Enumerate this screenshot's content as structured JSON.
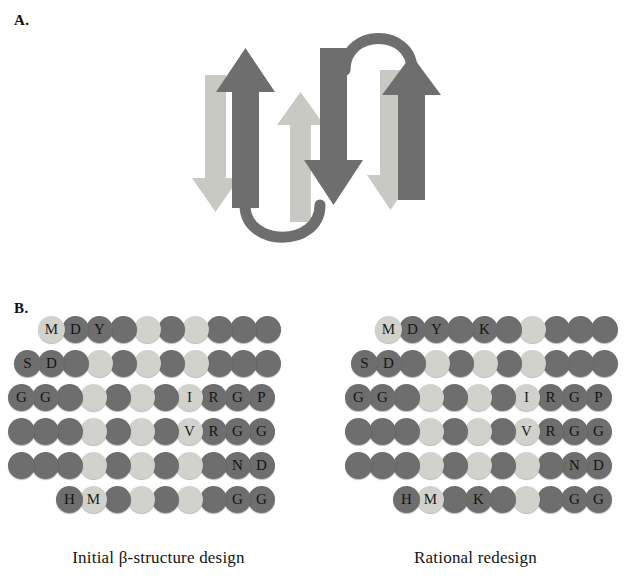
{
  "figure": {
    "panel_a_label": "A.",
    "panel_b_label": "B."
  },
  "colors": {
    "strand_dark": "#6e6e6e",
    "strand_light": "#c9c9c4",
    "residue_dark": "#6e6e6e",
    "residue_light": "#d2d2cd",
    "background": "#ffffff",
    "text": "#141414"
  },
  "panel_a": {
    "name": "beta-sheet-topology-diagram",
    "description": "Four-stranded antiparallel beta sheet topology with connecting loops",
    "strands": [
      {
        "id": "strand-1",
        "shade": "light",
        "direction": "down"
      },
      {
        "id": "strand-2",
        "shade": "dark",
        "direction": "up"
      },
      {
        "id": "strand-3",
        "shade": "light",
        "direction": "up"
      },
      {
        "id": "strand-4",
        "shade": "dark",
        "direction": "down"
      },
      {
        "id": "strand-5",
        "shade": "light",
        "direction": "down"
      },
      {
        "id": "strand-6",
        "shade": "dark",
        "direction": "up"
      }
    ],
    "loops": [
      {
        "id": "loop-top",
        "position": "top-right"
      },
      {
        "id": "loop-bottom",
        "position": "bottom-left"
      }
    ]
  },
  "panel_b": {
    "designs": [
      {
        "id": "initial-design",
        "caption": "Initial β-structure design",
        "rows": [
          {
            "indent": 38,
            "residues": [
              {
                "label": "M",
                "shade": "light"
              },
              {
                "label": "D",
                "shade": "dark"
              },
              {
                "label": "Y",
                "shade": "dark"
              },
              {
                "label": "",
                "shade": "dark"
              },
              {
                "label": "",
                "shade": "light"
              },
              {
                "label": "",
                "shade": "dark"
              },
              {
                "label": "",
                "shade": "light"
              },
              {
                "label": "",
                "shade": "dark"
              },
              {
                "label": "",
                "shade": "dark"
              },
              {
                "label": "",
                "shade": "dark"
              }
            ]
          },
          {
            "indent": 14,
            "residues": [
              {
                "label": "S",
                "shade": "dark"
              },
              {
                "label": "D",
                "shade": "dark"
              },
              {
                "label": "",
                "shade": "dark"
              },
              {
                "label": "",
                "shade": "light"
              },
              {
                "label": "",
                "shade": "dark"
              },
              {
                "label": "",
                "shade": "light"
              },
              {
                "label": "",
                "shade": "dark"
              },
              {
                "label": "",
                "shade": "light"
              },
              {
                "label": "",
                "shade": "dark"
              },
              {
                "label": "",
                "shade": "dark"
              },
              {
                "label": "",
                "shade": "dark"
              }
            ]
          },
          {
            "indent": 8,
            "residues": [
              {
                "label": "G",
                "shade": "dark"
              },
              {
                "label": "G",
                "shade": "dark"
              },
              {
                "label": "",
                "shade": "dark"
              },
              {
                "label": "",
                "shade": "light"
              },
              {
                "label": "",
                "shade": "dark"
              },
              {
                "label": "",
                "shade": "light"
              },
              {
                "label": "",
                "shade": "dark"
              },
              {
                "label": "I",
                "shade": "light"
              },
              {
                "label": "R",
                "shade": "dark"
              },
              {
                "label": "G",
                "shade": "dark"
              },
              {
                "label": "P",
                "shade": "dark"
              }
            ]
          },
          {
            "indent": 8,
            "residues": [
              {
                "label": "",
                "shade": "dark"
              },
              {
                "label": "",
                "shade": "dark"
              },
              {
                "label": "",
                "shade": "dark"
              },
              {
                "label": "",
                "shade": "light"
              },
              {
                "label": "",
                "shade": "dark"
              },
              {
                "label": "",
                "shade": "light"
              },
              {
                "label": "",
                "shade": "dark"
              },
              {
                "label": "V",
                "shade": "light"
              },
              {
                "label": "R",
                "shade": "dark"
              },
              {
                "label": "G",
                "shade": "dark"
              },
              {
                "label": "G",
                "shade": "dark"
              }
            ]
          },
          {
            "indent": 8,
            "residues": [
              {
                "label": "",
                "shade": "dark"
              },
              {
                "label": "",
                "shade": "dark"
              },
              {
                "label": "",
                "shade": "dark"
              },
              {
                "label": "",
                "shade": "light"
              },
              {
                "label": "",
                "shade": "dark"
              },
              {
                "label": "",
                "shade": "light"
              },
              {
                "label": "",
                "shade": "dark"
              },
              {
                "label": "",
                "shade": "light"
              },
              {
                "label": "",
                "shade": "dark"
              },
              {
                "label": "N",
                "shade": "dark"
              },
              {
                "label": "D",
                "shade": "dark"
              }
            ]
          },
          {
            "indent": 56,
            "residues": [
              {
                "label": "H",
                "shade": "dark"
              },
              {
                "label": "M",
                "shade": "light"
              },
              {
                "label": "",
                "shade": "dark"
              },
              {
                "label": "",
                "shade": "light"
              },
              {
                "label": "",
                "shade": "dark"
              },
              {
                "label": "",
                "shade": "light"
              },
              {
                "label": "",
                "shade": "dark"
              },
              {
                "label": "G",
                "shade": "dark"
              },
              {
                "label": "G",
                "shade": "dark"
              }
            ]
          }
        ]
      },
      {
        "id": "rational-redesign",
        "caption": "Rational redesign",
        "rows": [
          {
            "indent": 58,
            "residues": [
              {
                "label": "M",
                "shade": "light"
              },
              {
                "label": "D",
                "shade": "dark"
              },
              {
                "label": "Y",
                "shade": "dark"
              },
              {
                "label": "",
                "shade": "dark"
              },
              {
                "label": "K",
                "shade": "dark"
              },
              {
                "label": "",
                "shade": "dark"
              },
              {
                "label": "",
                "shade": "light"
              },
              {
                "label": "",
                "shade": "dark"
              },
              {
                "label": "",
                "shade": "dark"
              },
              {
                "label": "",
                "shade": "dark"
              }
            ]
          },
          {
            "indent": 34,
            "residues": [
              {
                "label": "S",
                "shade": "dark"
              },
              {
                "label": "D",
                "shade": "dark"
              },
              {
                "label": "",
                "shade": "dark"
              },
              {
                "label": "",
                "shade": "light"
              },
              {
                "label": "",
                "shade": "dark"
              },
              {
                "label": "",
                "shade": "light"
              },
              {
                "label": "",
                "shade": "dark"
              },
              {
                "label": "",
                "shade": "light"
              },
              {
                "label": "",
                "shade": "dark"
              },
              {
                "label": "",
                "shade": "dark"
              },
              {
                "label": "",
                "shade": "dark"
              }
            ]
          },
          {
            "indent": 28,
            "residues": [
              {
                "label": "G",
                "shade": "dark"
              },
              {
                "label": "G",
                "shade": "dark"
              },
              {
                "label": "",
                "shade": "dark"
              },
              {
                "label": "",
                "shade": "light"
              },
              {
                "label": "",
                "shade": "dark"
              },
              {
                "label": "",
                "shade": "light"
              },
              {
                "label": "",
                "shade": "dark"
              },
              {
                "label": "I",
                "shade": "light"
              },
              {
                "label": "R",
                "shade": "dark"
              },
              {
                "label": "G",
                "shade": "dark"
              },
              {
                "label": "P",
                "shade": "dark"
              }
            ]
          },
          {
            "indent": 28,
            "residues": [
              {
                "label": "",
                "shade": "dark"
              },
              {
                "label": "",
                "shade": "dark"
              },
              {
                "label": "",
                "shade": "dark"
              },
              {
                "label": "",
                "shade": "light"
              },
              {
                "label": "",
                "shade": "dark"
              },
              {
                "label": "",
                "shade": "light"
              },
              {
                "label": "",
                "shade": "dark"
              },
              {
                "label": "V",
                "shade": "light"
              },
              {
                "label": "R",
                "shade": "dark"
              },
              {
                "label": "G",
                "shade": "dark"
              },
              {
                "label": "G",
                "shade": "dark"
              }
            ]
          },
          {
            "indent": 28,
            "residues": [
              {
                "label": "",
                "shade": "dark"
              },
              {
                "label": "",
                "shade": "dark"
              },
              {
                "label": "",
                "shade": "dark"
              },
              {
                "label": "",
                "shade": "light"
              },
              {
                "label": "",
                "shade": "dark"
              },
              {
                "label": "",
                "shade": "light"
              },
              {
                "label": "",
                "shade": "dark"
              },
              {
                "label": "",
                "shade": "light"
              },
              {
                "label": "",
                "shade": "dark"
              },
              {
                "label": "N",
                "shade": "dark"
              },
              {
                "label": "D",
                "shade": "dark"
              }
            ]
          },
          {
            "indent": 76,
            "residues": [
              {
                "label": "H",
                "shade": "dark"
              },
              {
                "label": "M",
                "shade": "light"
              },
              {
                "label": "",
                "shade": "dark"
              },
              {
                "label": "K",
                "shade": "dark"
              },
              {
                "label": "",
                "shade": "dark"
              },
              {
                "label": "",
                "shade": "light"
              },
              {
                "label": "",
                "shade": "dark"
              },
              {
                "label": "G",
                "shade": "dark"
              },
              {
                "label": "G",
                "shade": "dark"
              }
            ]
          }
        ]
      }
    ]
  }
}
